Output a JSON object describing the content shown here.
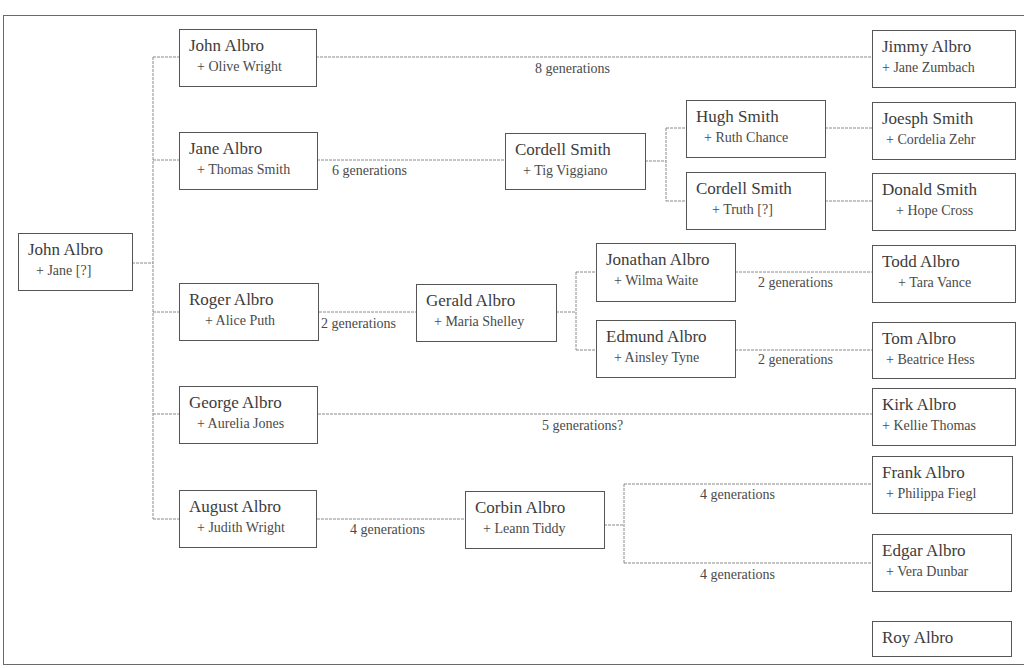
{
  "diagram": {
    "type": "family-tree",
    "title_fragment": "",
    "root": {
      "name": "John Albro",
      "spouse": "+ Jane [?]"
    },
    "people": [
      {
        "id": "john-albro-olive",
        "name": "John Albro",
        "spouse": "+ Olive Wright"
      },
      {
        "id": "jane-albro",
        "name": "Jane Albro",
        "spouse": "+ Thomas Smith"
      },
      {
        "id": "roger-albro",
        "name": "Roger Albro",
        "spouse": "+ Alice Puth"
      },
      {
        "id": "george-albro",
        "name": "George Albro",
        "spouse": "+ Aurelia Jones"
      },
      {
        "id": "august-albro",
        "name": "August Albro",
        "spouse": "+ Judith Wright"
      },
      {
        "id": "cordell-smith-tig",
        "name": "Cordell Smith",
        "spouse": "+ Tig Viggiano"
      },
      {
        "id": "gerald-albro",
        "name": "Gerald Albro",
        "spouse": "+ Maria Shelley"
      },
      {
        "id": "corbin-albro",
        "name": "Corbin Albro",
        "spouse": "+ Leann Tiddy"
      },
      {
        "id": "hugh-smith",
        "name": "Hugh Smith",
        "spouse": "+ Ruth Chance"
      },
      {
        "id": "cordell-smith-truth",
        "name": "Cordell Smith",
        "spouse": "+ Truth [?]"
      },
      {
        "id": "jonathan-albro",
        "name": "Jonathan Albro",
        "spouse": "+ Wilma Waite"
      },
      {
        "id": "edmund-albro",
        "name": "Edmund Albro",
        "spouse": "+ Ainsley Tyne"
      },
      {
        "id": "jimmy-albro",
        "name": "Jimmy Albro",
        "spouse": "+ Jane Zumbach"
      },
      {
        "id": "joesph-smith",
        "name": "Joesph Smith",
        "spouse": "+ Cordelia Zehr"
      },
      {
        "id": "donald-smith",
        "name": "Donald Smith",
        "spouse": "+ Hope Cross"
      },
      {
        "id": "todd-albro",
        "name": "Todd Albro",
        "spouse": "+ Tara Vance"
      },
      {
        "id": "tom-albro",
        "name": "Tom Albro",
        "spouse": "+ Beatrice Hess"
      },
      {
        "id": "kirk-albro",
        "name": "Kirk Albro",
        "spouse": "+ Kellie Thomas"
      },
      {
        "id": "frank-albro",
        "name": "Frank Albro",
        "spouse": "+ Philippa Fiegl"
      },
      {
        "id": "edgar-albro",
        "name": "Edgar Albro",
        "spouse": "+ Vera Dunbar"
      },
      {
        "id": "roy-albro",
        "name": "Roy Albro",
        "spouse": ""
      }
    ],
    "generation_labels": [
      {
        "from": "John Albro",
        "to": "Jimmy Albro",
        "text": "8 generations"
      },
      {
        "from": "Jane Albro",
        "to": "Cordell Smith",
        "text": "6 generations"
      },
      {
        "from": "Roger Albro",
        "to": "Gerald Albro",
        "text": "2 generations"
      },
      {
        "from": "Jonathan Albro",
        "to": "Todd Albro",
        "text": "2 generations"
      },
      {
        "from": "Edmund Albro",
        "to": "Tom Albro",
        "text": "2 generations"
      },
      {
        "from": "George Albro",
        "to": "Kirk Albro",
        "text": "5 generations?"
      },
      {
        "from": "August Albro",
        "to": "Corbin Albro",
        "text": "4 generations"
      },
      {
        "from": "Corbin Albro",
        "to": "Frank Albro",
        "text": "4 generations"
      },
      {
        "from": "Corbin Albro",
        "to": "Edgar Albro",
        "text": "4 generations"
      }
    ],
    "colors": {
      "box_border": "#555555",
      "line": "#8a8a8a",
      "text": "#3c3c3c",
      "background": "#ffffff"
    }
  }
}
